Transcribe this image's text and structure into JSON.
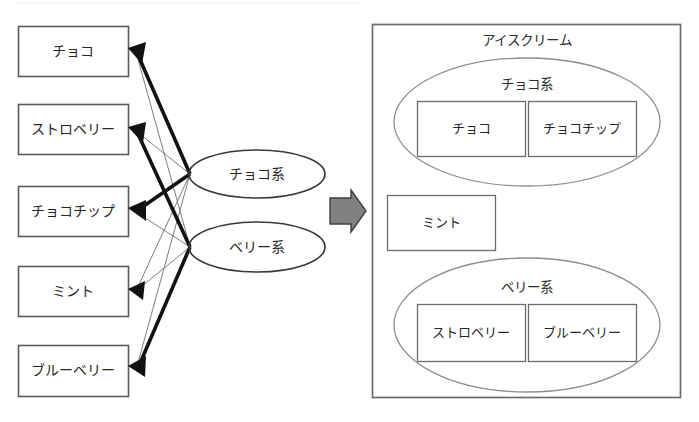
{
  "diagram": {
    "title_artifact": "",
    "left_panel": {
      "name": "flavor-to-group-mapping",
      "flavors": [
        {
          "id": "choco",
          "label": "チョコ"
        },
        {
          "id": "strawberry",
          "label": "ストロベリー"
        },
        {
          "id": "chocochip",
          "label": "チョコチップ"
        },
        {
          "id": "mint",
          "label": "ミント"
        },
        {
          "id": "blueberry",
          "label": "ブルーベリー"
        }
      ],
      "groups": [
        {
          "id": "choco-kei",
          "label": "チョコ系"
        },
        {
          "id": "berry-kei",
          "label": "ベリー系"
        }
      ],
      "edges": [
        {
          "from": "choco-kei",
          "to": "choco",
          "weight": "strong"
        },
        {
          "from": "choco-kei",
          "to": "strawberry",
          "weight": "weak"
        },
        {
          "from": "choco-kei",
          "to": "chocochip",
          "weight": "strong"
        },
        {
          "from": "choco-kei",
          "to": "mint",
          "weight": "weak"
        },
        {
          "from": "choco-kei",
          "to": "blueberry",
          "weight": "weak"
        },
        {
          "from": "berry-kei",
          "to": "choco",
          "weight": "weak"
        },
        {
          "from": "berry-kei",
          "to": "strawberry",
          "weight": "strong"
        },
        {
          "from": "berry-kei",
          "to": "chocochip",
          "weight": "weak"
        },
        {
          "from": "berry-kei",
          "to": "mint",
          "weight": "weak"
        },
        {
          "from": "berry-kei",
          "to": "blueberry",
          "weight": "strong"
        }
      ]
    },
    "transition": {
      "name": "right-block-arrow",
      "icon": "right-block-arrow-icon",
      "color": "#808080"
    },
    "right_panel": {
      "name": "clustered-result",
      "container_label": "アイスクリーム",
      "clusters": [
        {
          "id": "choco-cluster",
          "label": "チョコ系",
          "members": [
            "チョコ",
            "チョコチップ"
          ]
        },
        {
          "id": "berry-cluster",
          "label": "ベリー系",
          "members": [
            "ストロベリー",
            "ブルーベリー"
          ]
        }
      ],
      "standalone": [
        {
          "id": "mint-standalone",
          "label": "ミント"
        }
      ]
    },
    "colors": {
      "stroke_dark": "#111111",
      "stroke_mid": "#5a5a5a",
      "stroke_light": "#8e8e8e",
      "arrow_fill": "#808080",
      "background": "#ffffff"
    }
  }
}
